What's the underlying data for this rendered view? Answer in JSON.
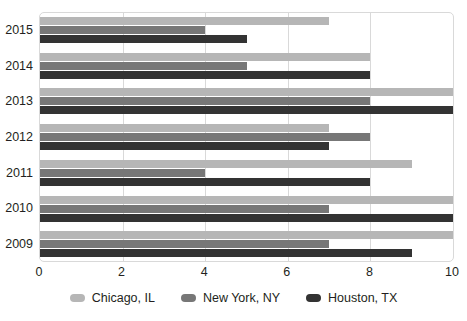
{
  "chart_data": {
    "type": "bar",
    "orientation": "horizontal",
    "title": "",
    "xlabel": "",
    "ylabel": "",
    "categories": [
      "2015",
      "2014",
      "2013",
      "2012",
      "2011",
      "2010",
      "2009"
    ],
    "xticks": [
      "0",
      "2",
      "4",
      "6",
      "8",
      "10"
    ],
    "xtick_values": [
      0,
      2,
      4,
      6,
      8,
      10
    ],
    "xlim": [
      0,
      10
    ],
    "grid": true,
    "legend_position": "bottom",
    "series": [
      {
        "name": "Chicago, IL",
        "color": "#b6b6b6",
        "values": [
          7,
          8,
          10,
          7,
          9,
          10,
          10
        ]
      },
      {
        "name": "New York, NY",
        "color": "#777777",
        "values": [
          4,
          5,
          8,
          8,
          4,
          7,
          7
        ]
      },
      {
        "name": "Houston, TX",
        "color": "#333333",
        "values": [
          5,
          8,
          10,
          7,
          8,
          10,
          9
        ]
      }
    ]
  }
}
